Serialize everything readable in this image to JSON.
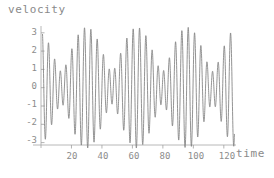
{
  "chart_data": {
    "type": "line",
    "title": "",
    "xlabel": "time",
    "ylabel": "velocity",
    "xlim": [
      0,
      128
    ],
    "ylim": [
      -3.4,
      3.4
    ],
    "xticks": [
      20,
      40,
      60,
      80,
      100,
      120
    ],
    "yticks": [
      3,
      2,
      1,
      0,
      -1,
      -2,
      -3
    ],
    "grid": false,
    "legend": null,
    "line_color": "#808080",
    "axis_color": "#a0a0a0",
    "text_color": "#8a8a8a",
    "series": [
      {
        "name": "velocity",
        "description": "Amplitude-modulated (beating) oscillation: superposition of two close-frequency sinusoids producing a repeating envelope with peaks near +3.3 and troughs near -3.2",
        "envelope_period": 32,
        "carrier_period": 4.55,
        "amplitude_max": 3.3,
        "amplitude_min": 0.9,
        "formula": "1.2*sin(2*pi*t/4.55) + 2.1*sin(2*pi*t/4.0 + 0.6)"
      }
    ],
    "x_axis_position_value": 0,
    "curve_start_x": 1,
    "curve_end_x": 127
  },
  "labels": {
    "y_axis_title": "velocity",
    "x_axis_title": "time",
    "ytick_3": "3",
    "ytick_2": "2",
    "ytick_1": "1",
    "ytick_0": "0",
    "ytick_m1": "-1",
    "ytick_m2": "-2",
    "ytick_m3": "-3",
    "xtick_20": "20",
    "xtick_40": "40",
    "xtick_60": "60",
    "xtick_80": "80",
    "xtick_100": "100",
    "xtick_120": "120"
  }
}
